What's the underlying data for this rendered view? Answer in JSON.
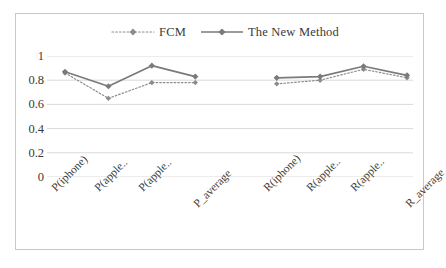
{
  "chart_data": {
    "type": "line",
    "title": "",
    "xlabel": "",
    "ylabel": "",
    "ylim": [
      0,
      1
    ],
    "yticks": [
      "0",
      "0.2",
      "0.4",
      "0.6",
      "0.8",
      "1"
    ],
    "grid": true,
    "legend_position": "top-center",
    "categories": [
      "P(iphone)",
      "P(apple..",
      "P(apple..",
      "P_average",
      "R(iphone)",
      "R(apple..",
      "R(apple..",
      "R_average"
    ],
    "series": [
      {
        "name": "FCM",
        "style": "dotted",
        "marker": "diamond",
        "color": "#8c8c8c",
        "values": [
          0.86,
          0.65,
          0.78,
          0.78,
          0.77,
          0.8,
          0.89,
          0.82
        ]
      },
      {
        "name": "The New Method",
        "style": "solid",
        "marker": "diamond",
        "color": "#7a7a7a",
        "values": [
          0.87,
          0.75,
          0.92,
          0.83,
          0.82,
          0.83,
          0.915,
          0.84
        ]
      }
    ],
    "group_break_after_index": 3
  },
  "legend": {
    "entries": [
      {
        "label": "FCM"
      },
      {
        "label": "The New Method"
      }
    ]
  },
  "colors": {
    "frame": "#c8c8c8",
    "grid": "#d9d9d9",
    "text": "#3a3a3a",
    "series_fcm": "#8c8c8c",
    "series_new": "#7a7a7a"
  }
}
